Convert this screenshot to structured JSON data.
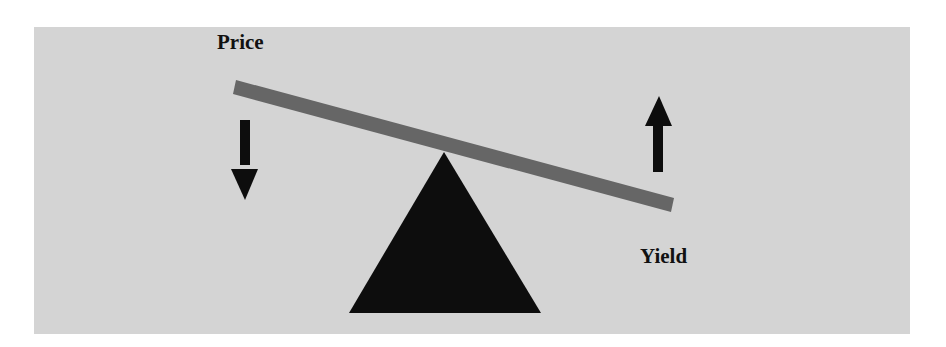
{
  "diagram": {
    "labels": {
      "price": "Price",
      "yield": "Yield"
    },
    "arrows": [
      {
        "name": "price-down-arrow",
        "direction": "down",
        "meaning": "Price falls"
      },
      {
        "name": "yield-up-arrow",
        "direction": "up",
        "meaning": "Yield rises"
      }
    ],
    "colors": {
      "background": "#d4d4d4",
      "beam": "#666666",
      "fulcrum": "#0d0d0d",
      "arrow": "#0d0d0d",
      "text": "#111111"
    }
  }
}
